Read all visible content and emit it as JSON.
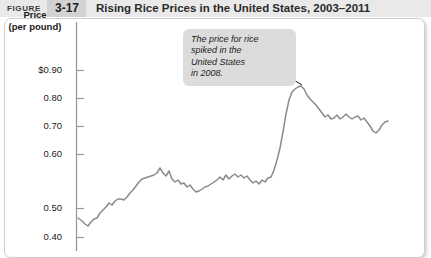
{
  "header": {
    "figure_label": "FIGURE",
    "figure_number": "3-17",
    "title": "Rising Rice Prices in the United States, 2003–2011",
    "band_color": "#e9e9e9",
    "number_box_color": "#d2d2d2"
  },
  "axis": {
    "y_title_line1": "Price",
    "y_title_line2": "(per pound)"
  },
  "callout": {
    "line1": "The price for rice",
    "line2": "spiked in the",
    "line3": "United States",
    "line4": "in 2008.",
    "background": "#dcdcdc"
  },
  "chart_data": {
    "type": "line",
    "title": "Rising Rice Prices in the United States, 2003–2011",
    "xlabel": "",
    "ylabel": "Price (per pound)",
    "ylim": [
      0.35,
      0.95
    ],
    "grid": false,
    "legend": null,
    "line_color": "#8a8a8a",
    "y_ticks": [
      {
        "value": 0.9,
        "label": "$0.90",
        "y_px": 70
      },
      {
        "value": 0.8,
        "label": "0.80",
        "y_px": 98
      },
      {
        "value": 0.7,
        "label": "0.70",
        "y_px": 126
      },
      {
        "value": 0.6,
        "label": "0.60",
        "y_px": 154
      },
      {
        "value": 0.5,
        "label": "0.50",
        "y_px": 208
      },
      {
        "value": 0.4,
        "label": "0.40",
        "y_px": 237
      }
    ],
    "annotation": "The price for rice spiked in the United States in 2008.",
    "series": [
      {
        "name": "U.S. rice price (per pound)",
        "points": [
          [
            78,
            218
          ],
          [
            82,
            221
          ],
          [
            85,
            224
          ],
          [
            88,
            226
          ],
          [
            91,
            222
          ],
          [
            94,
            219
          ],
          [
            97,
            218
          ],
          [
            100,
            213
          ],
          [
            103,
            210
          ],
          [
            106,
            207
          ],
          [
            109,
            203
          ],
          [
            112,
            205
          ],
          [
            115,
            201
          ],
          [
            118,
            199
          ],
          [
            121,
            199
          ],
          [
            124,
            200
          ],
          [
            127,
            197
          ],
          [
            130,
            193
          ],
          [
            133,
            190
          ],
          [
            136,
            186
          ],
          [
            139,
            182
          ],
          [
            142,
            179
          ],
          [
            145,
            178
          ],
          [
            148,
            177
          ],
          [
            151,
            176
          ],
          [
            154,
            175
          ],
          [
            157,
            173
          ],
          [
            160,
            168
          ],
          [
            163,
            173
          ],
          [
            166,
            176
          ],
          [
            169,
            171
          ],
          [
            172,
            179
          ],
          [
            175,
            182
          ],
          [
            178,
            180
          ],
          [
            181,
            184
          ],
          [
            184,
            183
          ],
          [
            187,
            187
          ],
          [
            190,
            185
          ],
          [
            193,
            189
          ],
          [
            196,
            192
          ],
          [
            199,
            191
          ],
          [
            202,
            189
          ],
          [
            205,
            187
          ],
          [
            208,
            186
          ],
          [
            211,
            184
          ],
          [
            214,
            182
          ],
          [
            217,
            180
          ],
          [
            220,
            177
          ],
          [
            223,
            180
          ],
          [
            226,
            175
          ],
          [
            229,
            179
          ],
          [
            232,
            176
          ],
          [
            235,
            174
          ],
          [
            238,
            177
          ],
          [
            241,
            175
          ],
          [
            244,
            178
          ],
          [
            247,
            176
          ],
          [
            250,
            180
          ],
          [
            253,
            183
          ],
          [
            256,
            181
          ],
          [
            259,
            184
          ],
          [
            262,
            180
          ],
          [
            265,
            182
          ],
          [
            268,
            178
          ],
          [
            271,
            177
          ],
          [
            274,
            170
          ],
          [
            277,
            160
          ],
          [
            280,
            148
          ],
          [
            283,
            132
          ],
          [
            286,
            114
          ],
          [
            289,
            100
          ],
          [
            292,
            92
          ],
          [
            295,
            89
          ],
          [
            298,
            87
          ],
          [
            301,
            86
          ],
          [
            304,
            89
          ],
          [
            307,
            95
          ],
          [
            310,
            99
          ],
          [
            313,
            102
          ],
          [
            316,
            105
          ],
          [
            319,
            109
          ],
          [
            322,
            113
          ],
          [
            325,
            117
          ],
          [
            328,
            115
          ],
          [
            331,
            119
          ],
          [
            334,
            118
          ],
          [
            337,
            115
          ],
          [
            340,
            119
          ],
          [
            343,
            117
          ],
          [
            346,
            114
          ],
          [
            349,
            117
          ],
          [
            352,
            119
          ],
          [
            355,
            117
          ],
          [
            358,
            116
          ],
          [
            361,
            120
          ],
          [
            364,
            118
          ],
          [
            367,
            122
          ],
          [
            370,
            126
          ],
          [
            373,
            131
          ],
          [
            376,
            133
          ],
          [
            379,
            130
          ],
          [
            382,
            125
          ],
          [
            385,
            122
          ],
          [
            388,
            121
          ]
        ]
      }
    ]
  }
}
